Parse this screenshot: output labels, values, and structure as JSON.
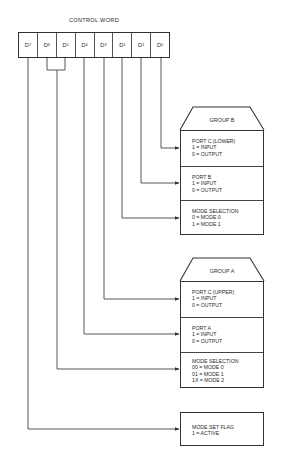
{
  "title": "CONTROL WORD",
  "bits": [
    {
      "base": "D",
      "sub": "7"
    },
    {
      "base": "D",
      "sub": "6"
    },
    {
      "base": "D",
      "sub": "5"
    },
    {
      "base": "D",
      "sub": "4"
    },
    {
      "base": "D",
      "sub": "3"
    },
    {
      "base": "D",
      "sub": "2"
    },
    {
      "base": "D",
      "sub": "1"
    },
    {
      "base": "D",
      "sub": "0"
    }
  ],
  "group_b": {
    "label": "GROUP B",
    "sections": [
      {
        "title": "PORT C (LOWER)",
        "line1": "1 = INPUT",
        "line2": "0 = OUTPUT",
        "bit": "D0"
      },
      {
        "title": "PORT B",
        "line1": "1 = INPUT",
        "line2": "0 = OUTPUT",
        "bit": "D1"
      },
      {
        "title": "MODE SELECTION",
        "line1": "0 = MODE 0",
        "line2": "1 = MODE 1",
        "bit": "D2"
      }
    ]
  },
  "group_a": {
    "label": "GROUP A",
    "sections": [
      {
        "title": "PORT C (UPPER)",
        "line1": "1 = INPUT",
        "line2": "0 = OUTPUT",
        "bit": "D3"
      },
      {
        "title": "PORT A",
        "line1": "1 = INPUT",
        "line2": "0 = OUTPUT",
        "bit": "D4"
      },
      {
        "title": "MODE SELECTION",
        "line1": "00 = MODE 0",
        "line2": "01 = MODE 1",
        "line3": "1X = MODE 2",
        "bit": "D6-D5"
      }
    ]
  },
  "mode_set_flag": {
    "title": "MODE SET FLAG",
    "line1": "1 = ACTIVE",
    "bit": "D7"
  },
  "colors": {
    "line": "#333333",
    "background": "#ffffff"
  }
}
